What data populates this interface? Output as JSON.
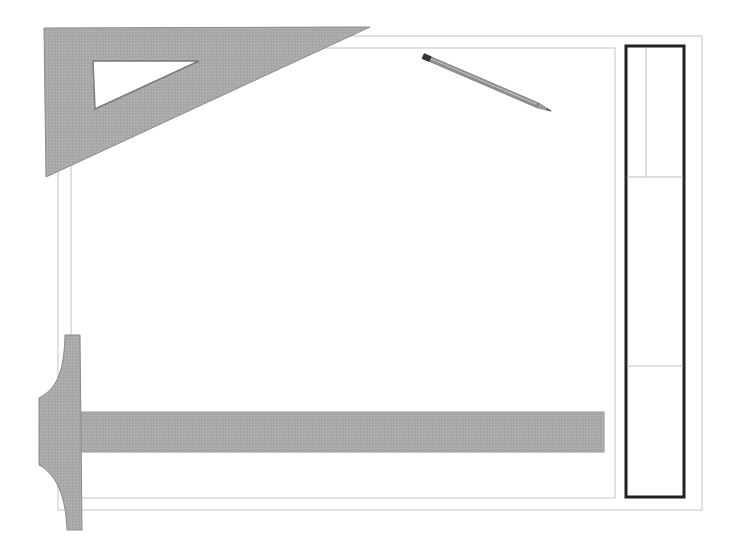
{
  "scene": {
    "title": "Drafting board with set square, T-square, pencil and title block",
    "background": "#ffffff"
  },
  "colors": {
    "tool_fill": "#a9a9a9",
    "tool_edge": "#8a8a8a",
    "board_line": "#c4c4c4",
    "title_block_border": "#222222",
    "title_block_line": "#bdbdbd",
    "pencil_body": "#8f8f8f",
    "pencil_cap": "#333333",
    "pencil_tip": "#555555"
  },
  "board": {
    "outer": {
      "x1": 58,
      "y1": 36,
      "x2": 702,
      "y2": 510
    },
    "inner": {
      "x1": 71,
      "y1": 48,
      "x2": 615,
      "y2": 498
    }
  },
  "set_square": {
    "outer_points": "44,28 370,27 46,177",
    "cutout_points": "93,61 199,61 95,109"
  },
  "pencil": {
    "start": {
      "x": 423,
      "y": 56
    },
    "end": {
      "x": 551,
      "y": 111
    },
    "width": 5
  },
  "t_square": {
    "head_path": "M65,335 L80,335 L82,530 L67,530 C66,500 58,475 39,465 L39,398 C58,388 64,370 65,335 Z",
    "blade": {
      "x": 80,
      "y": 412,
      "width": 524,
      "height": 40
    }
  },
  "title_block": {
    "frame": {
      "x": 626,
      "y": 46,
      "width": 58,
      "height": 451,
      "stroke_width": 3
    },
    "vertical_divider": {
      "x": 646,
      "y1": 48,
      "y2": 177
    },
    "horizontal_dividers": [
      177,
      366
    ]
  }
}
